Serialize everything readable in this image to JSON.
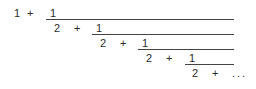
{
  "document": {
    "type": "mathematical-expression",
    "description": "continued fraction",
    "text_color": "#2b2b2b",
    "rule_color": "#444444",
    "background_color": "#ffffff"
  },
  "expression": {
    "leading_term": "1",
    "operator": "+",
    "ellipsis": "...",
    "levels": [
      {
        "index": 0,
        "lead": "1",
        "operator": "+",
        "numerator": "1",
        "lead_x": 14,
        "operator_x": 27,
        "numerator_x": 50,
        "bar_x": 46,
        "bar_width": 188,
        "y": 6
      },
      {
        "index": 1,
        "lead": "2",
        "operator": "+",
        "numerator": "1",
        "lead_x": 54,
        "operator_x": 74,
        "numerator_x": 96,
        "bar_x": 92,
        "bar_width": 142,
        "y": 21
      },
      {
        "index": 2,
        "lead": "2",
        "operator": "+",
        "numerator": "1",
        "lead_x": 100,
        "operator_x": 120,
        "numerator_x": 142,
        "bar_x": 138,
        "bar_width": 96,
        "y": 36
      },
      {
        "index": 3,
        "lead": "2",
        "operator": "+",
        "numerator": "1",
        "lead_x": 146,
        "operator_x": 166,
        "numerator_x": 189,
        "bar_x": 185,
        "bar_width": 49,
        "y": 51
      },
      {
        "index": 4,
        "lead": "2",
        "operator": "+",
        "numerator": "...",
        "lead_x": 192,
        "operator_x": 212,
        "numerator_x": 232,
        "bar_x": 0,
        "bar_width": 0,
        "y": 66
      }
    ]
  }
}
